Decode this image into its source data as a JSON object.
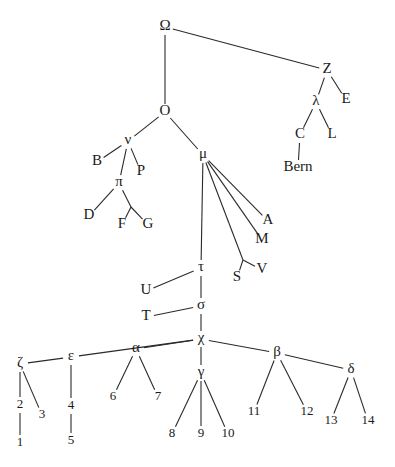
{
  "diagram": {
    "type": "stemma",
    "nodes": [
      {
        "id": "Omega",
        "label": "Ω",
        "x": 165,
        "y": 27
      },
      {
        "id": "Z",
        "label": "Z",
        "x": 327,
        "y": 70
      },
      {
        "id": "E",
        "label": "E",
        "x": 346,
        "y": 100
      },
      {
        "id": "lambda",
        "label": "λ",
        "x": 316,
        "y": 102
      },
      {
        "id": "C",
        "label": "C",
        "x": 300,
        "y": 135
      },
      {
        "id": "L",
        "label": "L",
        "x": 332,
        "y": 135
      },
      {
        "id": "Bern",
        "label": "Bern",
        "x": 298,
        "y": 168
      },
      {
        "id": "O",
        "label": "O",
        "x": 165,
        "y": 112
      },
      {
        "id": "nu",
        "label": "ν",
        "x": 128,
        "y": 141
      },
      {
        "id": "B",
        "label": "B",
        "x": 97,
        "y": 162
      },
      {
        "id": "P",
        "label": "P",
        "x": 141,
        "y": 172
      },
      {
        "id": "pi",
        "label": "π",
        "x": 119,
        "y": 183
      },
      {
        "id": "D",
        "label": "D",
        "x": 89,
        "y": 216
      },
      {
        "id": "F",
        "label": "F",
        "x": 122,
        "y": 225
      },
      {
        "id": "G",
        "label": "G",
        "x": 148,
        "y": 225
      },
      {
        "id": "mu",
        "label": "μ",
        "x": 203,
        "y": 155
      },
      {
        "id": "A",
        "label": "A",
        "x": 268,
        "y": 221
      },
      {
        "id": "M",
        "label": "M",
        "x": 262,
        "y": 240
      },
      {
        "id": "S",
        "label": "S",
        "x": 237,
        "y": 278
      },
      {
        "id": "V",
        "label": "V",
        "x": 262,
        "y": 270
      },
      {
        "id": "tau",
        "label": "τ",
        "x": 201,
        "y": 268
      },
      {
        "id": "U",
        "label": "U",
        "x": 146,
        "y": 291
      },
      {
        "id": "sigma",
        "label": "σ",
        "x": 201,
        "y": 306
      },
      {
        "id": "T",
        "label": "T",
        "x": 146,
        "y": 317
      },
      {
        "id": "chi",
        "label": "χ",
        "x": 201,
        "y": 339
      },
      {
        "id": "zeta",
        "label": "ζ",
        "x": 20,
        "y": 364
      },
      {
        "id": "epsilon",
        "label": "ε",
        "x": 71,
        "y": 357
      },
      {
        "id": "alpha",
        "label": "α",
        "x": 136,
        "y": 349
      },
      {
        "id": "gamma",
        "label": "γ",
        "x": 201,
        "y": 373
      },
      {
        "id": "beta",
        "label": "β",
        "x": 277,
        "y": 353
      },
      {
        "id": "delta",
        "label": "δ",
        "x": 351,
        "y": 370
      },
      {
        "id": "n2",
        "label": "2",
        "x": 20,
        "y": 405
      },
      {
        "id": "n3",
        "label": "3",
        "x": 42,
        "y": 415
      },
      {
        "id": "n1",
        "label": "1",
        "x": 20,
        "y": 443
      },
      {
        "id": "n4",
        "label": "4",
        "x": 71,
        "y": 406
      },
      {
        "id": "n5",
        "label": "5",
        "x": 71,
        "y": 441
      },
      {
        "id": "n6",
        "label": "6",
        "x": 113,
        "y": 397
      },
      {
        "id": "n7",
        "label": "7",
        "x": 158,
        "y": 397
      },
      {
        "id": "n8",
        "label": "8",
        "x": 172,
        "y": 434
      },
      {
        "id": "n9",
        "label": "9",
        "x": 201,
        "y": 434
      },
      {
        "id": "n10",
        "label": "10",
        "x": 228,
        "y": 434
      },
      {
        "id": "n11",
        "label": "11",
        "x": 254,
        "y": 412
      },
      {
        "id": "n12",
        "label": "12",
        "x": 307,
        "y": 412
      },
      {
        "id": "n13",
        "label": "13",
        "x": 331,
        "y": 421
      },
      {
        "id": "n14",
        "label": "14",
        "x": 368,
        "y": 421
      }
    ],
    "edges": [
      [
        "Omega",
        "Z"
      ],
      [
        "Omega",
        "O"
      ],
      [
        "Z",
        "lambda"
      ],
      [
        "Z",
        "E"
      ],
      [
        "lambda",
        "C"
      ],
      [
        "lambda",
        "L"
      ],
      [
        "C",
        "Bern"
      ],
      [
        "O",
        "nu"
      ],
      [
        "O",
        "mu"
      ],
      [
        "nu",
        "B"
      ],
      [
        "nu",
        "P"
      ],
      [
        "nu",
        "pi"
      ],
      [
        "pi",
        "D"
      ],
      [
        "pi",
        "FG"
      ],
      [
        "mu",
        "A"
      ],
      [
        "mu",
        "M"
      ],
      [
        "mu",
        "SV"
      ],
      [
        "mu",
        "tau"
      ],
      [
        "tau",
        "U"
      ],
      [
        "tau",
        "sigma"
      ],
      [
        "sigma",
        "T"
      ],
      [
        "sigma",
        "chi"
      ],
      [
        "chi",
        "epsilon"
      ],
      [
        "chi",
        "alpha"
      ],
      [
        "chi",
        "gamma"
      ],
      [
        "chi",
        "beta"
      ],
      [
        "epsilon",
        "zeta"
      ],
      [
        "zeta",
        "n2"
      ],
      [
        "zeta",
        "n3"
      ],
      [
        "n2",
        "n1"
      ],
      [
        "epsilon",
        "n4"
      ],
      [
        "n4",
        "n5"
      ],
      [
        "alpha",
        "n6"
      ],
      [
        "alpha",
        "n7"
      ],
      [
        "gamma",
        "n8"
      ],
      [
        "gamma",
        "n9"
      ],
      [
        "gamma",
        "n10"
      ],
      [
        "beta",
        "n11"
      ],
      [
        "beta",
        "n12"
      ],
      [
        "beta",
        "delta"
      ],
      [
        "delta",
        "n13"
      ],
      [
        "delta",
        "n14"
      ]
    ],
    "hidden_nodes": [
      {
        "id": "FG",
        "x": 131,
        "y": 207
      },
      {
        "id": "SV",
        "x": 243,
        "y": 260
      }
    ]
  }
}
